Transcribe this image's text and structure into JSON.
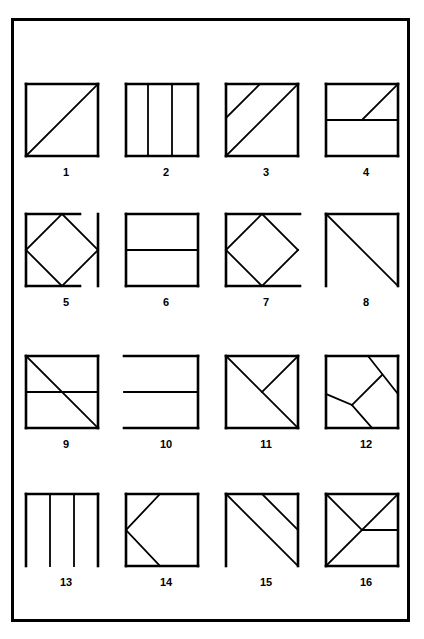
{
  "page": {
    "background_color": "#ffffff",
    "ink_color": "#000000",
    "frame": {
      "x": 11,
      "y": 18,
      "width": 399,
      "height": 604,
      "border_px": 3
    },
    "columns": 4,
    "rows": 4
  },
  "figures": [
    {
      "label": "1",
      "name": "figure-1-square-with-diagonal",
      "cell": {
        "x": 16,
        "y": 78
      },
      "box": {
        "x": 10,
        "y": 6,
        "w": 72,
        "h": 72
      },
      "strokes": [
        {
          "kind": "line",
          "x1": 10,
          "y1": 6,
          "x2": 82,
          "y2": 6,
          "w": 2.6
        },
        {
          "kind": "line",
          "x1": 82,
          "y1": 6,
          "x2": 82,
          "y2": 78,
          "w": 2.6
        },
        {
          "kind": "line",
          "x1": 82,
          "y1": 78,
          "x2": 10,
          "y2": 78,
          "w": 2.6
        },
        {
          "kind": "line",
          "x1": 10,
          "y1": 78,
          "x2": 10,
          "y2": 6,
          "w": 2.6
        },
        {
          "kind": "line",
          "x1": 10,
          "y1": 78,
          "x2": 82,
          "y2": 6,
          "w": 1.8
        }
      ],
      "label_pos": {
        "y": 88
      }
    },
    {
      "label": "2",
      "name": "figure-2-square-three-vertical-strips",
      "cell": {
        "x": 116,
        "y": 78
      },
      "box": {
        "x": 10,
        "y": 6,
        "w": 72,
        "h": 72
      },
      "strokes": [
        {
          "kind": "line",
          "x1": 10,
          "y1": 6,
          "x2": 82,
          "y2": 6,
          "w": 2.6
        },
        {
          "kind": "line",
          "x1": 82,
          "y1": 6,
          "x2": 82,
          "y2": 78,
          "w": 2.6
        },
        {
          "kind": "line",
          "x1": 82,
          "y1": 78,
          "x2": 10,
          "y2": 78,
          "w": 2.6
        },
        {
          "kind": "line",
          "x1": 10,
          "y1": 78,
          "x2": 10,
          "y2": 6,
          "w": 2.6
        },
        {
          "kind": "line",
          "x1": 32,
          "y1": 6,
          "x2": 32,
          "y2": 78,
          "w": 1.8
        },
        {
          "kind": "line",
          "x1": 56,
          "y1": 6,
          "x2": 56,
          "y2": 78,
          "w": 1.8
        }
      ],
      "label_pos": {
        "y": 88
      }
    },
    {
      "label": "3",
      "name": "figure-3-square-diagonal-plus-parallel",
      "cell": {
        "x": 216,
        "y": 78
      },
      "box": {
        "x": 10,
        "y": 6,
        "w": 72,
        "h": 72
      },
      "strokes": [
        {
          "kind": "line",
          "x1": 10,
          "y1": 6,
          "x2": 82,
          "y2": 6,
          "w": 2.6
        },
        {
          "kind": "line",
          "x1": 82,
          "y1": 6,
          "x2": 82,
          "y2": 78,
          "w": 2.6
        },
        {
          "kind": "line",
          "x1": 82,
          "y1": 78,
          "x2": 10,
          "y2": 78,
          "w": 2.6
        },
        {
          "kind": "line",
          "x1": 10,
          "y1": 78,
          "x2": 10,
          "y2": 6,
          "w": 2.6
        },
        {
          "kind": "line",
          "x1": 10,
          "y1": 78,
          "x2": 82,
          "y2": 6,
          "w": 1.8
        },
        {
          "kind": "line",
          "x1": 10,
          "y1": 40,
          "x2": 44,
          "y2": 6,
          "w": 1.8
        }
      ],
      "label_pos": {
        "y": 88
      }
    },
    {
      "label": "4",
      "name": "figure-4-square-midline-and-corner-diagonal",
      "cell": {
        "x": 316,
        "y": 78
      },
      "box": {
        "x": 10,
        "y": 6,
        "w": 72,
        "h": 72
      },
      "strokes": [
        {
          "kind": "line",
          "x1": 10,
          "y1": 6,
          "x2": 82,
          "y2": 6,
          "w": 2.6
        },
        {
          "kind": "line",
          "x1": 82,
          "y1": 6,
          "x2": 82,
          "y2": 78,
          "w": 2.6
        },
        {
          "kind": "line",
          "x1": 82,
          "y1": 78,
          "x2": 10,
          "y2": 78,
          "w": 2.6
        },
        {
          "kind": "line",
          "x1": 10,
          "y1": 78,
          "x2": 10,
          "y2": 6,
          "w": 2.6
        },
        {
          "kind": "line",
          "x1": 10,
          "y1": 42,
          "x2": 82,
          "y2": 42,
          "w": 1.8
        },
        {
          "kind": "line",
          "x1": 46,
          "y1": 42,
          "x2": 82,
          "y2": 6,
          "w": 1.8
        }
      ],
      "label_pos": {
        "y": 88
      }
    },
    {
      "label": "5",
      "name": "figure-5-inscribed-diamond-detached-right-edge",
      "cell": {
        "x": 16,
        "y": 208
      },
      "box": {
        "x": 10,
        "y": 6,
        "w": 60,
        "h": 72
      },
      "strokes": [
        {
          "kind": "line",
          "x1": 10,
          "y1": 6,
          "x2": 64,
          "y2": 6,
          "w": 2.6
        },
        {
          "kind": "line",
          "x1": 10,
          "y1": 6,
          "x2": 10,
          "y2": 78,
          "w": 2.6
        },
        {
          "kind": "line",
          "x1": 10,
          "y1": 78,
          "x2": 64,
          "y2": 78,
          "w": 2.6
        },
        {
          "kind": "line",
          "x1": 82,
          "y1": 6,
          "x2": 82,
          "y2": 78,
          "w": 2.6
        },
        {
          "kind": "line",
          "x1": 46,
          "y1": 6,
          "x2": 82,
          "y2": 42,
          "w": 1.8
        },
        {
          "kind": "line",
          "x1": 82,
          "y1": 42,
          "x2": 46,
          "y2": 78,
          "w": 1.8
        },
        {
          "kind": "line",
          "x1": 46,
          "y1": 78,
          "x2": 10,
          "y2": 42,
          "w": 1.8
        },
        {
          "kind": "line",
          "x1": 10,
          "y1": 42,
          "x2": 46,
          "y2": 6,
          "w": 1.8
        }
      ],
      "label_pos": {
        "y": 88
      }
    },
    {
      "label": "6",
      "name": "figure-6-square-with-horizontal-midline",
      "cell": {
        "x": 116,
        "y": 208
      },
      "box": {
        "x": 10,
        "y": 6,
        "w": 72,
        "h": 72
      },
      "strokes": [
        {
          "kind": "line",
          "x1": 10,
          "y1": 6,
          "x2": 82,
          "y2": 6,
          "w": 2.6
        },
        {
          "kind": "line",
          "x1": 82,
          "y1": 6,
          "x2": 82,
          "y2": 78,
          "w": 2.6
        },
        {
          "kind": "line",
          "x1": 82,
          "y1": 78,
          "x2": 10,
          "y2": 78,
          "w": 2.6
        },
        {
          "kind": "line",
          "x1": 10,
          "y1": 78,
          "x2": 10,
          "y2": 6,
          "w": 2.6
        },
        {
          "kind": "line",
          "x1": 10,
          "y1": 42,
          "x2": 82,
          "y2": 42,
          "w": 1.8
        }
      ],
      "label_pos": {
        "y": 88
      }
    },
    {
      "label": "7",
      "name": "figure-7-inscribed-diamond-missing-right-edge",
      "cell": {
        "x": 216,
        "y": 208
      },
      "box": {
        "x": 10,
        "y": 6,
        "w": 72,
        "h": 72
      },
      "strokes": [
        {
          "kind": "line",
          "x1": 10,
          "y1": 6,
          "x2": 84,
          "y2": 6,
          "w": 2.6
        },
        {
          "kind": "line",
          "x1": 10,
          "y1": 6,
          "x2": 10,
          "y2": 78,
          "w": 2.6
        },
        {
          "kind": "line",
          "x1": 10,
          "y1": 78,
          "x2": 84,
          "y2": 78,
          "w": 2.6
        },
        {
          "kind": "line",
          "x1": 46,
          "y1": 6,
          "x2": 82,
          "y2": 42,
          "w": 1.8
        },
        {
          "kind": "line",
          "x1": 82,
          "y1": 42,
          "x2": 46,
          "y2": 78,
          "w": 1.8
        },
        {
          "kind": "line",
          "x1": 46,
          "y1": 78,
          "x2": 10,
          "y2": 42,
          "w": 1.8
        },
        {
          "kind": "line",
          "x1": 10,
          "y1": 42,
          "x2": 46,
          "y2": 6,
          "w": 1.8
        }
      ],
      "label_pos": {
        "y": 88
      }
    },
    {
      "label": "8",
      "name": "figure-8-open-square-with-antidiagonal",
      "cell": {
        "x": 316,
        "y": 208
      },
      "box": {
        "x": 10,
        "y": 6,
        "w": 72,
        "h": 72
      },
      "strokes": [
        {
          "kind": "line",
          "x1": 10,
          "y1": 6,
          "x2": 82,
          "y2": 6,
          "w": 2.6
        },
        {
          "kind": "line",
          "x1": 82,
          "y1": 6,
          "x2": 82,
          "y2": 78,
          "w": 2.6
        },
        {
          "kind": "line",
          "x1": 10,
          "y1": 6,
          "x2": 10,
          "y2": 78,
          "w": 2.6
        },
        {
          "kind": "line",
          "x1": 10,
          "y1": 6,
          "x2": 82,
          "y2": 78,
          "w": 1.8
        }
      ],
      "label_pos": {
        "y": 88
      }
    },
    {
      "label": "9",
      "name": "figure-9-square-midline-and-antidiagonal",
      "cell": {
        "x": 16,
        "y": 350
      },
      "box": {
        "x": 10,
        "y": 6,
        "w": 72,
        "h": 72
      },
      "strokes": [
        {
          "kind": "line",
          "x1": 10,
          "y1": 6,
          "x2": 82,
          "y2": 6,
          "w": 2.6
        },
        {
          "kind": "line",
          "x1": 82,
          "y1": 6,
          "x2": 82,
          "y2": 78,
          "w": 2.6
        },
        {
          "kind": "line",
          "x1": 82,
          "y1": 78,
          "x2": 10,
          "y2": 78,
          "w": 2.6
        },
        {
          "kind": "line",
          "x1": 10,
          "y1": 78,
          "x2": 10,
          "y2": 6,
          "w": 2.6
        },
        {
          "kind": "line",
          "x1": 10,
          "y1": 42,
          "x2": 82,
          "y2": 42,
          "w": 1.8
        },
        {
          "kind": "line",
          "x1": 10,
          "y1": 6,
          "x2": 82,
          "y2": 78,
          "w": 1.8
        }
      ],
      "label_pos": {
        "y": 88
      }
    },
    {
      "label": "10",
      "name": "figure-10-open-left-square-with-midline",
      "cell": {
        "x": 116,
        "y": 350
      },
      "box": {
        "x": 10,
        "y": 6,
        "w": 72,
        "h": 72
      },
      "strokes": [
        {
          "kind": "line",
          "x1": 8,
          "y1": 6,
          "x2": 82,
          "y2": 6,
          "w": 2.6
        },
        {
          "kind": "line",
          "x1": 82,
          "y1": 6,
          "x2": 82,
          "y2": 78,
          "w": 2.6
        },
        {
          "kind": "line",
          "x1": 8,
          "y1": 78,
          "x2": 82,
          "y2": 78,
          "w": 2.6
        },
        {
          "kind": "line",
          "x1": 8,
          "y1": 42,
          "x2": 82,
          "y2": 42,
          "w": 1.8
        }
      ],
      "label_pos": {
        "y": 88
      }
    },
    {
      "label": "11",
      "name": "figure-11-square-antidiagonal-and-half-diagonal",
      "cell": {
        "x": 216,
        "y": 350
      },
      "box": {
        "x": 10,
        "y": 6,
        "w": 72,
        "h": 72
      },
      "strokes": [
        {
          "kind": "line",
          "x1": 10,
          "y1": 6,
          "x2": 82,
          "y2": 6,
          "w": 2.6
        },
        {
          "kind": "line",
          "x1": 82,
          "y1": 6,
          "x2": 82,
          "y2": 78,
          "w": 2.6
        },
        {
          "kind": "line",
          "x1": 82,
          "y1": 78,
          "x2": 10,
          "y2": 78,
          "w": 2.6
        },
        {
          "kind": "line",
          "x1": 10,
          "y1": 78,
          "x2": 10,
          "y2": 6,
          "w": 2.6
        },
        {
          "kind": "line",
          "x1": 10,
          "y1": 6,
          "x2": 82,
          "y2": 78,
          "w": 1.8
        },
        {
          "kind": "line",
          "x1": 82,
          "y1": 6,
          "x2": 46,
          "y2": 42,
          "w": 1.8
        }
      ],
      "label_pos": {
        "y": 88
      }
    },
    {
      "label": "12",
      "name": "figure-12-square-with-zigzag-chords",
      "cell": {
        "x": 316,
        "y": 350
      },
      "box": {
        "x": 10,
        "y": 6,
        "w": 72,
        "h": 72
      },
      "strokes": [
        {
          "kind": "line",
          "x1": 10,
          "y1": 6,
          "x2": 82,
          "y2": 6,
          "w": 2.6
        },
        {
          "kind": "line",
          "x1": 82,
          "y1": 6,
          "x2": 82,
          "y2": 78,
          "w": 2.6
        },
        {
          "kind": "line",
          "x1": 82,
          "y1": 78,
          "x2": 10,
          "y2": 78,
          "w": 2.6
        },
        {
          "kind": "line",
          "x1": 10,
          "y1": 78,
          "x2": 10,
          "y2": 6,
          "w": 2.6
        },
        {
          "kind": "line",
          "x1": 52,
          "y1": 6,
          "x2": 82,
          "y2": 44,
          "w": 1.8
        },
        {
          "kind": "line",
          "x1": 66,
          "y1": 25,
          "x2": 36,
          "y2": 55,
          "w": 1.8
        },
        {
          "kind": "line",
          "x1": 36,
          "y1": 55,
          "x2": 10,
          "y2": 44,
          "w": 1.8
        },
        {
          "kind": "line",
          "x1": 36,
          "y1": 55,
          "x2": 56,
          "y2": 78,
          "w": 1.8
        }
      ],
      "label_pos": {
        "y": 88
      }
    },
    {
      "label": "13",
      "name": "figure-13-open-bottom-square-with-verticals",
      "cell": {
        "x": 16,
        "y": 488
      },
      "box": {
        "x": 10,
        "y": 6,
        "w": 72,
        "h": 72
      },
      "strokes": [
        {
          "kind": "line",
          "x1": 10,
          "y1": 6,
          "x2": 82,
          "y2": 6,
          "w": 2.6
        },
        {
          "kind": "line",
          "x1": 10,
          "y1": 6,
          "x2": 10,
          "y2": 78,
          "w": 2.6
        },
        {
          "kind": "line",
          "x1": 82,
          "y1": 6,
          "x2": 82,
          "y2": 78,
          "w": 2.6
        },
        {
          "kind": "line",
          "x1": 34,
          "y1": 6,
          "x2": 34,
          "y2": 78,
          "w": 1.8
        },
        {
          "kind": "line",
          "x1": 58,
          "y1": 6,
          "x2": 58,
          "y2": 78,
          "w": 1.8
        }
      ],
      "label_pos": {
        "y": 88
      }
    },
    {
      "label": "14",
      "name": "figure-14-square-with-left-chevron",
      "cell": {
        "x": 116,
        "y": 488
      },
      "box": {
        "x": 10,
        "y": 6,
        "w": 72,
        "h": 72
      },
      "strokes": [
        {
          "kind": "line",
          "x1": 10,
          "y1": 6,
          "x2": 82,
          "y2": 6,
          "w": 2.6
        },
        {
          "kind": "line",
          "x1": 82,
          "y1": 6,
          "x2": 82,
          "y2": 78,
          "w": 2.6
        },
        {
          "kind": "line",
          "x1": 82,
          "y1": 78,
          "x2": 10,
          "y2": 78,
          "w": 2.6
        },
        {
          "kind": "line",
          "x1": 10,
          "y1": 78,
          "x2": 10,
          "y2": 6,
          "w": 2.6
        },
        {
          "kind": "line",
          "x1": 44,
          "y1": 6,
          "x2": 10,
          "y2": 42,
          "w": 1.8
        },
        {
          "kind": "line",
          "x1": 10,
          "y1": 42,
          "x2": 44,
          "y2": 78,
          "w": 1.8
        }
      ],
      "label_pos": {
        "y": 88
      }
    },
    {
      "label": "15",
      "name": "figure-15-open-bottom-square-antidiagonal-plus-parallel",
      "cell": {
        "x": 216,
        "y": 488
      },
      "box": {
        "x": 10,
        "y": 6,
        "w": 72,
        "h": 72
      },
      "strokes": [
        {
          "kind": "line",
          "x1": 10,
          "y1": 6,
          "x2": 82,
          "y2": 6,
          "w": 2.6
        },
        {
          "kind": "line",
          "x1": 82,
          "y1": 6,
          "x2": 82,
          "y2": 78,
          "w": 2.6
        },
        {
          "kind": "line",
          "x1": 10,
          "y1": 6,
          "x2": 10,
          "y2": 78,
          "w": 2.6
        },
        {
          "kind": "line",
          "x1": 10,
          "y1": 6,
          "x2": 82,
          "y2": 78,
          "w": 1.8
        },
        {
          "kind": "line",
          "x1": 46,
          "y1": 6,
          "x2": 82,
          "y2": 42,
          "w": 1.8
        }
      ],
      "label_pos": {
        "y": 88
      }
    },
    {
      "label": "16",
      "name": "figure-16-square-diagonal-halfdiagonal-and-half-midline",
      "cell": {
        "x": 316,
        "y": 488
      },
      "box": {
        "x": 10,
        "y": 6,
        "w": 72,
        "h": 72
      },
      "strokes": [
        {
          "kind": "line",
          "x1": 10,
          "y1": 6,
          "x2": 82,
          "y2": 6,
          "w": 2.6
        },
        {
          "kind": "line",
          "x1": 82,
          "y1": 6,
          "x2": 82,
          "y2": 78,
          "w": 2.6
        },
        {
          "kind": "line",
          "x1": 82,
          "y1": 78,
          "x2": 10,
          "y2": 78,
          "w": 2.6
        },
        {
          "kind": "line",
          "x1": 10,
          "y1": 78,
          "x2": 10,
          "y2": 6,
          "w": 2.6
        },
        {
          "kind": "line",
          "x1": 10,
          "y1": 78,
          "x2": 82,
          "y2": 6,
          "w": 1.8
        },
        {
          "kind": "line",
          "x1": 10,
          "y1": 6,
          "x2": 46,
          "y2": 42,
          "w": 1.8
        },
        {
          "kind": "line",
          "x1": 46,
          "y1": 42,
          "x2": 82,
          "y2": 42,
          "w": 1.8
        }
      ],
      "label_pos": {
        "y": 88
      }
    }
  ]
}
